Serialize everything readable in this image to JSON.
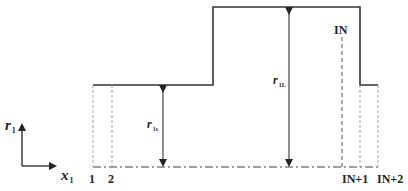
{
  "diagram": {
    "axes": {
      "vertical_label": "r",
      "vertical_sub": "1",
      "horizontal_label": "x",
      "horizontal_sub": "1"
    },
    "dimensions": {
      "short_radius_label": "r",
      "short_radius_sub": "1s",
      "long_radius_label": "r",
      "long_radius_sub": "1L"
    },
    "node_labels": {
      "n1": "1",
      "n2": "2",
      "nIN": "IN",
      "nIN1": "IN+1",
      "nIN2": "IN+2"
    },
    "colors": {
      "stroke": "#333333",
      "dashed": "#888888"
    }
  }
}
